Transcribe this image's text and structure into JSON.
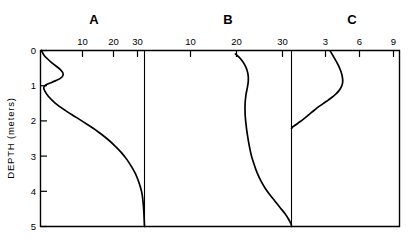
{
  "chart_data": {
    "type": "line",
    "title": "",
    "subtitle": "",
    "ylabel": "DEPTH (meters)",
    "xlabel": "",
    "ylim": [
      0,
      5
    ],
    "y_ticks": [
      "0",
      "1",
      "2",
      "3",
      "4",
      "5"
    ],
    "y_tick_values": [
      0,
      1,
      2,
      3,
      4,
      5
    ],
    "orientation": "depth-profile-vertical",
    "grid": false,
    "legend": "none",
    "panels": [
      {
        "label": "A",
        "xlim": [
          0,
          32
        ],
        "x_ticks": [
          "10",
          "20",
          "30"
        ],
        "x_tick_values": [
          10,
          20,
          30
        ],
        "series": [
          {
            "name": "A",
            "x": [
              0.3,
              1.2,
              3.5,
              6.2,
              7.0,
              6.0,
              3.6,
              1.6,
              1.0,
              1.3,
              2.4,
              4.6,
              7.6,
              11.0,
              14.4,
              17.6,
              20.4,
              22.8,
              24.9,
              26.6,
              28.0,
              29.2,
              30.1,
              30.8,
              31.3,
              31.6,
              31.8,
              31.9,
              32.0
            ],
            "y": [
              0.0,
              0.15,
              0.35,
              0.55,
              0.68,
              0.8,
              0.9,
              0.98,
              1.05,
              1.15,
              1.3,
              1.5,
              1.7,
              1.9,
              2.1,
              2.3,
              2.5,
              2.7,
              2.9,
              3.1,
              3.3,
              3.5,
              3.7,
              3.9,
              4.1,
              4.35,
              4.6,
              4.8,
              5.0
            ]
          }
        ]
      },
      {
        "label": "B",
        "xlim": [
          0,
          32
        ],
        "x_ticks": [
          "10",
          "20",
          "30"
        ],
        "x_tick_values": [
          10,
          20,
          30
        ],
        "series": [
          {
            "name": "B",
            "x": [
              19.8,
              21.0,
              22.0,
              22.5,
              22.6,
              22.4,
              22.1,
              21.9,
              21.9,
              22.1,
              22.4,
              22.8,
              23.3,
              23.9,
              24.6,
              25.4,
              26.3,
              27.3,
              28.4,
              29.5,
              30.6,
              31.4,
              31.9,
              32.0
            ],
            "y": [
              0.1,
              0.25,
              0.45,
              0.65,
              0.85,
              1.05,
              1.25,
              1.5,
              1.8,
              2.1,
              2.4,
              2.7,
              3.0,
              3.25,
              3.5,
              3.72,
              3.92,
              4.1,
              4.28,
              4.46,
              4.64,
              4.8,
              4.93,
              5.0
            ]
          }
        ]
      },
      {
        "label": "C",
        "xlim": [
          0,
          9.6
        ],
        "x_ticks": [
          "3",
          "6",
          "9"
        ],
        "x_tick_values": [
          3,
          6,
          9
        ],
        "series": [
          {
            "name": "C",
            "x": [
              3.45,
              3.75,
              4.1,
              4.38,
              4.52,
              4.55,
              4.45,
              4.22,
              3.9,
              3.52,
              3.12,
              2.72,
              2.36,
              2.05,
              1.78,
              1.52,
              1.26,
              0.98,
              0.68,
              0.38,
              0.1,
              0.0
            ],
            "y": [
              0.02,
              0.18,
              0.38,
              0.58,
              0.75,
              0.9,
              1.02,
              1.14,
              1.25,
              1.35,
              1.44,
              1.53,
              1.61,
              1.69,
              1.76,
              1.83,
              1.9,
              1.97,
              2.04,
              2.11,
              2.17,
              2.22
            ]
          }
        ]
      }
    ]
  }
}
